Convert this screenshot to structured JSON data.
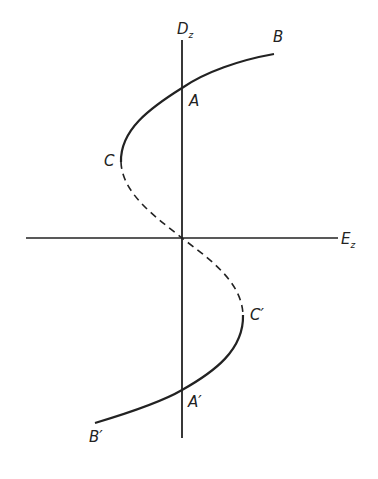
{
  "figure": {
    "axes": {
      "vertical_label": "D",
      "vertical_subscript": "z",
      "horizontal_label": "E",
      "horizontal_subscript": "z"
    },
    "points": {
      "A": "A",
      "B": "B",
      "C": "C",
      "A_prime": "A′",
      "B_prime": "B′",
      "C_prime": "C′"
    },
    "curve": {
      "description": "S-shaped hysteresis curve: solid stable branches B–A–C and C′–A′–B′, dashed unstable branch C–origin–C′",
      "color": "#222222"
    }
  }
}
